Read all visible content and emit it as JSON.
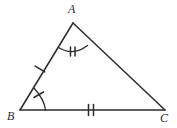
{
  "figure": {
    "name": "triangle-abc-congruence-marks",
    "background_color": "#ffffff",
    "stroke_color": "#2b2b2b",
    "stroke_width": 1.5,
    "width": 177,
    "height": 128
  },
  "vertices": [
    {
      "id": "A",
      "label": "A",
      "x": 73,
      "y": 23,
      "label_x": 68,
      "label_y": 3
    },
    {
      "id": "B",
      "label": "B",
      "x": 20,
      "y": 110,
      "label_x": 7,
      "label_y": 110
    },
    {
      "id": "C",
      "label": "C",
      "x": 165,
      "y": 110,
      "label_x": 160,
      "label_y": 112
    }
  ],
  "sides": [
    {
      "id": "AB",
      "from": "B",
      "to": "A",
      "tick_count": 1,
      "tick_label": "single-tick"
    },
    {
      "id": "BC",
      "from": "B",
      "to": "C",
      "tick_count": 2,
      "tick_label": "double-tick"
    },
    {
      "id": "AC",
      "from": "A",
      "to": "C",
      "tick_count": 0,
      "tick_label": "none"
    }
  ],
  "angles": [
    {
      "id": "A",
      "arc": true,
      "tick_count": 2,
      "tick_label": "double-tick"
    },
    {
      "id": "B",
      "arc": true,
      "tick_count": 1,
      "tick_label": "single-tick"
    },
    {
      "id": "C",
      "arc": false,
      "tick_count": 0,
      "tick_label": "none"
    }
  ]
}
